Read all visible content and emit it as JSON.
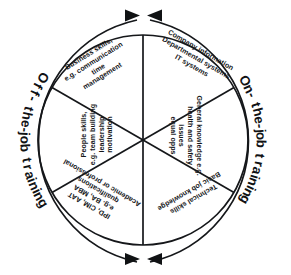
{
  "diagram": {
    "type": "segmented-circle",
    "segment_count": 6,
    "colors": {
      "stroke": "#15171a",
      "background": "#ffffff",
      "text": "#15171a"
    },
    "outer_labels": [
      {
        "id": "off-the-job-training",
        "text": "Off- the-job training",
        "side": "left"
      },
      {
        "id": "on-the-job-training",
        "text": "On- the-job training",
        "side": "right"
      }
    ],
    "arrows": [
      {
        "id": "arrow-top-left",
        "direction": "right",
        "position": "top"
      },
      {
        "id": "arrow-top-right",
        "direction": "left",
        "position": "top"
      },
      {
        "id": "arrow-bottom-left",
        "direction": "right",
        "position": "bottom"
      },
      {
        "id": "arrow-bottom-right",
        "direction": "left",
        "position": "bottom"
      }
    ],
    "segments": [
      {
        "id": "business-skills",
        "position": "top-left",
        "group": "off-the-job-training",
        "lines": [
          "Business skills,",
          "e.g. communication",
          "time",
          "management"
        ]
      },
      {
        "id": "company-information",
        "position": "top-right",
        "group": "on-the-job-training",
        "lines": [
          "Company information",
          "Departmental systems",
          "IT systems"
        ]
      },
      {
        "id": "general-knowledge",
        "position": "right",
        "group": "on-the-job-training",
        "lines": [
          "General knowledge e.g.",
          "health and safety",
          "issues",
          "equal opps"
        ]
      },
      {
        "id": "technical-skills",
        "position": "bottom-right",
        "group": "on-the-job-training",
        "lines": [
          "Technical skills",
          "Basic job knowledge"
        ]
      },
      {
        "id": "academic-qualifications",
        "position": "bottom-left",
        "group": "off-the-job-training",
        "lines": [
          "Academic or professional",
          "qualifications",
          "e.g. BA, MBA",
          "IPD, CIM, AAT"
        ]
      },
      {
        "id": "people-skills",
        "position": "left",
        "group": "off-the-job-training",
        "lines": [
          "People skills,",
          "e.g. team building",
          "leadership",
          "motivation"
        ]
      }
    ]
  }
}
